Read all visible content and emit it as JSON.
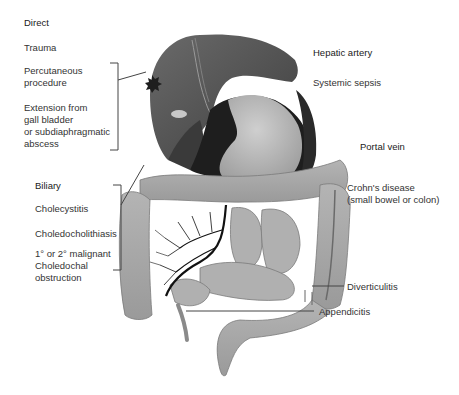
{
  "diagram": {
    "type": "anatomical-illustration",
    "organs": [
      "liver",
      "stomach",
      "gallbladder",
      "transverse colon",
      "ascending colon",
      "descending colon",
      "small bowel",
      "appendix",
      "sigmoid colon",
      "portal venous system"
    ],
    "colors": {
      "liver": "#5a5a5a",
      "liver_dark": "#3a3a3a",
      "stomach": "#b8b8b8",
      "stomach_shadow": "#1e1e1e",
      "bowel": "#a8a8a8",
      "bowel_outline": "#6e6e6e",
      "vessels": "#111111",
      "leader_lines": "#444444"
    }
  },
  "labels": {
    "direct": {
      "heading": "Direct",
      "items": [
        "Trauma",
        "Percutaneous",
        "procedure",
        "Extension from",
        "gall bladder",
        "or subdiaphragmatic",
        "abscess"
      ]
    },
    "hepatic_artery": {
      "heading": "Hepatic artery",
      "items": [
        "Systemic sepsis"
      ]
    },
    "portal_vein": {
      "heading": "Portal vein",
      "items": [
        "Crohn's disease",
        "(small bowel or colon)",
        "Diverticulitis",
        "Appendicitis"
      ]
    },
    "biliary": {
      "heading": "Biliary",
      "items": [
        "Cholecystitis",
        "Choledocholithiasis",
        "1° or 2° malignant",
        "Choledochal",
        "obstruction"
      ]
    }
  }
}
